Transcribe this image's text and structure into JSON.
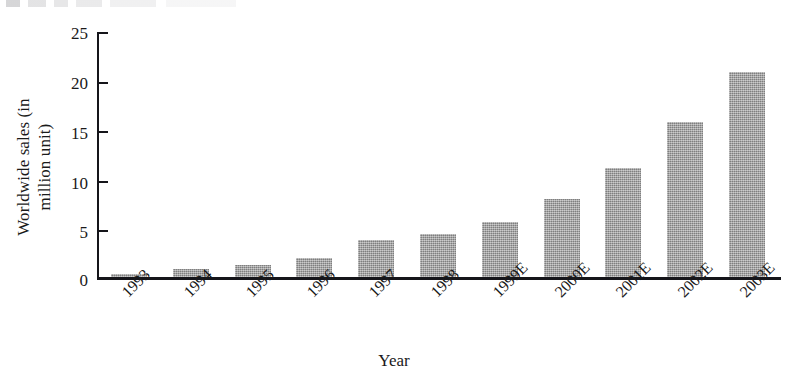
{
  "chart_data": {
    "type": "bar",
    "title": "",
    "xlabel": "Year",
    "ylabel": "Worldwide sales (in\nmillion unit)",
    "categories": [
      "1993",
      "1994",
      "1995",
      "1996",
      "1997",
      "1998",
      "1999E",
      "2000E",
      "2001E",
      "2002E",
      "2003E"
    ],
    "values": [
      0.3,
      0.8,
      1.2,
      1.9,
      3.7,
      4.4,
      5.6,
      7.9,
      11.0,
      15.7,
      20.7
    ],
    "ylim": [
      0,
      25
    ],
    "ytick_labels": [
      "0",
      "5",
      "10",
      "15",
      "20",
      "25"
    ],
    "ytick_values": [
      0,
      5,
      10,
      15,
      20,
      25
    ],
    "grid": false,
    "legend": "none",
    "series_name": "Worldwide sales",
    "bar_color": "#9b9b9b",
    "axis_color": "#15151a",
    "background_color": "#ffffff",
    "note": "Labels ending in E denote estimated values"
  }
}
